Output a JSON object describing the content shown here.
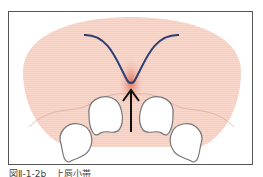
{
  "figure": {
    "caption": "図Ⅱ-1-2b　上唇小帯",
    "colors": {
      "tissue": "#f7cfc0",
      "frenum": "#d9624a",
      "curve": "#2b3f73",
      "arrow": "#111111",
      "tooth_outline": "#777777",
      "frame": "#555555"
    },
    "elements": [
      {
        "name": "gingiva-region",
        "label": ""
      },
      {
        "name": "frenum-curve",
        "label": ""
      },
      {
        "name": "arrow",
        "label": ""
      },
      {
        "name": "teeth",
        "label": ""
      }
    ]
  }
}
